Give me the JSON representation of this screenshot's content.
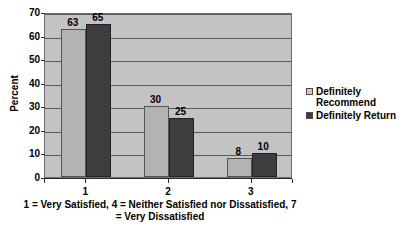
{
  "chart_data": {
    "type": "bar",
    "title": "",
    "subtitle": "",
    "xlabel": "1 = Very Satisfied, 4 = Neither Satisfied\nnor Dissatisfied, 7 = Very Dissatisfied",
    "ylabel": "Percent",
    "ylim": [
      0,
      70
    ],
    "ytick_step": 10,
    "yticks": [
      70,
      60,
      50,
      40,
      30,
      20,
      10,
      0
    ],
    "ytick_labels": [
      "70",
      "60",
      "50",
      "40",
      "30",
      "20",
      "10",
      "0"
    ],
    "categories": [
      "1",
      "2",
      "3"
    ],
    "grid": true,
    "grid_axis": "y",
    "legend_position": "right",
    "series": [
      {
        "name": "Definitely\nRecommend",
        "color": "#b3b3b3",
        "values": [
          63,
          30,
          8
        ],
        "value_labels": [
          "63",
          "30",
          "8"
        ]
      },
      {
        "name": "Definitely Return",
        "color": "#3d3d3d",
        "values": [
          65,
          25,
          10
        ],
        "value_labels": [
          "65",
          "25",
          "10"
        ]
      }
    ]
  },
  "colors": {
    "plot_background": "#c3c3c3",
    "page_background": "#ffffff",
    "gridline": "#5a5a5a",
    "axis": "#2b2b2b",
    "series_light": "#b3b3b3",
    "series_dark": "#3d3d3d"
  }
}
